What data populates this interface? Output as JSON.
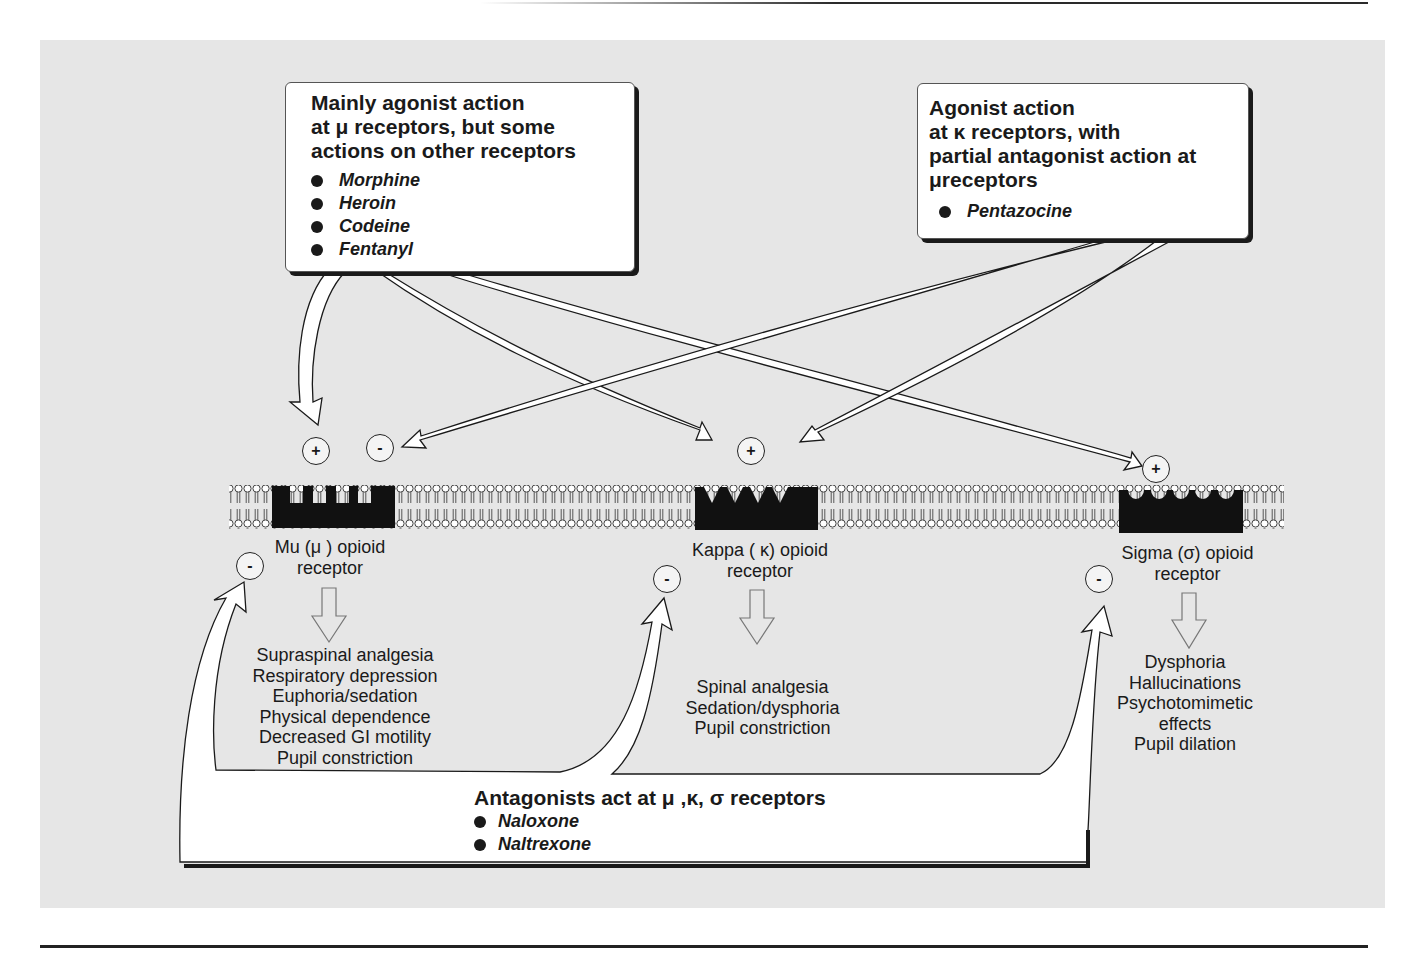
{
  "mu_agonist_box": {
    "title_lines": [
      "Mainly agonist action",
      "at μ receptors, but some",
      "actions on other receptors"
    ],
    "drugs": [
      "Morphine",
      "Heroin",
      "Codeine",
      "Fentanyl"
    ]
  },
  "kappa_agonist_box": {
    "title_lines": [
      "Agonist action",
      "at κ receptors, with",
      "partial antagonist action at",
      "μreceptors"
    ],
    "drugs": [
      "Pentazocine"
    ]
  },
  "receptors": [
    {
      "name_line1": "Mu (μ ) opioid",
      "name_line2": "receptor",
      "effects": [
        "Supraspinal analgesia",
        "Respiratory depression",
        "Euphoria/sedation",
        "Physical dependence",
        "Decreased GI motility",
        "Pupil constriction"
      ]
    },
    {
      "name_line1": "Kappa ( κ) opioid",
      "name_line2": "receptor",
      "effects": [
        "Spinal analgesia",
        "Sedation/dysphoria",
        "Pupil constriction"
      ]
    },
    {
      "name_line1": "Sigma (σ) opioid",
      "name_line2": "receptor",
      "effects": [
        "Dysphoria",
        "Hallucinations",
        "Psychotomimetic",
        "effects",
        "Pupil dilation"
      ]
    }
  ],
  "signs": {
    "plus": "+",
    "minus": "-"
  },
  "antagonists": {
    "title": "Antagonists act at μ ,κ, σ receptors",
    "drugs": [
      "Naloxone",
      "Naltrexone"
    ]
  },
  "colors": {
    "panel": "#e6e6e6",
    "ink": "#1a1a1a",
    "box": "#ffffff"
  }
}
